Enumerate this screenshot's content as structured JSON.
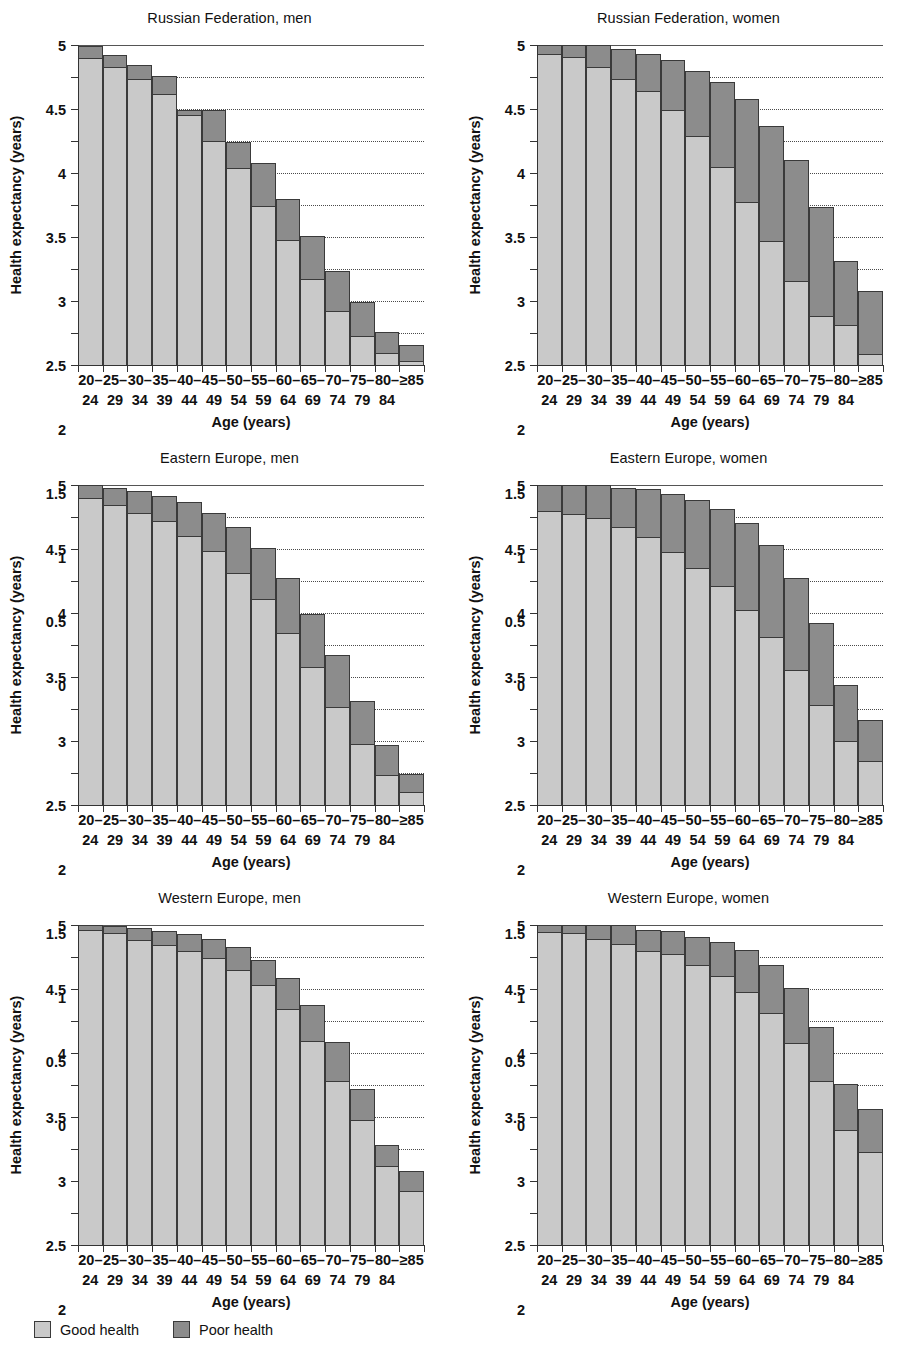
{
  "figure": {
    "y_axis_title": "Health expectancy (years)",
    "x_axis_title": "Age (years)",
    "y_ticks": [
      "0",
      "0.5",
      "1",
      "1.5",
      "2",
      "2.5",
      "3",
      "3.5",
      "4",
      "4.5",
      "5"
    ],
    "age_top": [
      "20–",
      "25–",
      "30–",
      "35–",
      "40–",
      "45–",
      "50–",
      "55–",
      "60–",
      "65–",
      "70–",
      "75–",
      "80–",
      "≥85"
    ],
    "age_bottom": [
      "24",
      "29",
      "34",
      "39",
      "44",
      "49",
      "54",
      "59",
      "64",
      "69",
      "74",
      "79",
      "84",
      ""
    ],
    "legend": [
      {
        "label": "Good health",
        "color": "#c9c9c9",
        "key": "good"
      },
      {
        "label": "Poor health",
        "color": "#8c8c8c",
        "key": "poor"
      }
    ],
    "panel_titles": [
      "Russian Federation, men",
      "Russian Federation, women",
      "Eastern Europe, men",
      "Eastern Europe, women",
      "Western Europe, men",
      "Western Europe, women"
    ]
  },
  "chart_data": [
    {
      "type": "bar",
      "title": "Russian Federation, men",
      "xlabel": "Age (years)",
      "ylabel": "Health expectancy (years)",
      "ylim": [
        0,
        5
      ],
      "grid": true,
      "stacked": true,
      "legend_position": "figure-bottom-left",
      "categories": [
        "20–24",
        "25–29",
        "30–34",
        "35–39",
        "40–44",
        "45–49",
        "50–54",
        "55–59",
        "60–64",
        "65–69",
        "70–74",
        "75–79",
        "80–84",
        "≥85"
      ],
      "series": [
        {
          "name": "Good health",
          "color": "#c9c9c9",
          "values": [
            4.79,
            4.66,
            4.47,
            4.23,
            3.9,
            3.5,
            3.08,
            2.48,
            1.96,
            1.34,
            0.85,
            0.46,
            0.18,
            0.06
          ]
        },
        {
          "name": "Poor health",
          "color": "#8c8c8c",
          "values": [
            0.2,
            0.19,
            0.21,
            0.28,
            0.09,
            0.48,
            0.4,
            0.67,
            0.63,
            0.68,
            0.62,
            0.52,
            0.34,
            0.26
          ]
        }
      ],
      "totals": [
        4.99,
        4.85,
        4.68,
        4.51,
        3.99,
        3.98,
        3.48,
        3.15,
        2.59,
        2.02,
        1.47,
        0.98,
        0.52,
        0.32
      ]
    },
    {
      "type": "bar",
      "title": "Russian Federation, women",
      "xlabel": "Age (years)",
      "ylabel": "Health expectancy (years)",
      "ylim": [
        0,
        5
      ],
      "grid": true,
      "stacked": true,
      "legend_position": "figure-bottom-left",
      "categories": [
        "20–24",
        "25–29",
        "30–34",
        "35–39",
        "40–44",
        "45–49",
        "50–54",
        "55–59",
        "60–64",
        "65–69",
        "70–74",
        "75–79",
        "80–84",
        "≥85"
      ],
      "series": [
        {
          "name": "Good health",
          "color": "#c9c9c9",
          "values": [
            4.86,
            4.81,
            4.66,
            4.47,
            4.28,
            3.99,
            3.58,
            3.09,
            2.54,
            1.93,
            1.31,
            0.76,
            0.63,
            0.17
          ]
        },
        {
          "name": "Poor health",
          "color": "#8c8c8c",
          "values": [
            0.14,
            0.19,
            0.34,
            0.46,
            0.58,
            0.78,
            1.02,
            1.34,
            1.61,
            1.81,
            1.89,
            1.71,
            1.0,
            0.99
          ]
        }
      ],
      "totals": [
        5.0,
        5.0,
        5.0,
        4.93,
        4.86,
        4.77,
        4.6,
        4.43,
        4.15,
        3.74,
        3.2,
        2.47,
        1.63,
        1.16
      ]
    },
    {
      "type": "bar",
      "title": "Eastern Europe, men",
      "xlabel": "Age (years)",
      "ylabel": "Health expectancy (years)",
      "ylim": [
        0,
        5
      ],
      "grid": true,
      "stacked": true,
      "legend_position": "figure-bottom-left",
      "categories": [
        "20–24",
        "25–29",
        "30–34",
        "35–39",
        "40–44",
        "45–49",
        "50–54",
        "55–59",
        "60–64",
        "65–69",
        "70–74",
        "75–79",
        "80–84",
        "≥85"
      ],
      "series": [
        {
          "name": "Good health",
          "color": "#c9c9c9",
          "values": [
            4.79,
            4.68,
            4.56,
            4.44,
            4.2,
            3.97,
            3.62,
            3.22,
            2.69,
            2.15,
            1.53,
            0.96,
            0.47,
            0.21
          ]
        },
        {
          "name": "Poor health",
          "color": "#8c8c8c",
          "values": [
            0.21,
            0.27,
            0.34,
            0.39,
            0.53,
            0.59,
            0.72,
            0.8,
            0.86,
            0.84,
            0.81,
            0.67,
            0.47,
            0.27
          ]
        }
      ],
      "totals": [
        5.0,
        4.95,
        4.9,
        4.83,
        4.73,
        4.56,
        4.34,
        4.02,
        3.55,
        2.99,
        2.34,
        1.63,
        0.94,
        0.48
      ]
    },
    {
      "type": "bar",
      "title": "Eastern Europe, women",
      "xlabel": "Age (years)",
      "ylabel": "Health expectancy (years)",
      "ylim": [
        0,
        5
      ],
      "grid": true,
      "stacked": true,
      "legend_position": "figure-bottom-left",
      "categories": [
        "20–24",
        "25–29",
        "30–34",
        "35–39",
        "40–44",
        "45–49",
        "50–54",
        "55–59",
        "60–64",
        "65–69",
        "70–74",
        "75–79",
        "80–84",
        "≥85"
      ],
      "series": [
        {
          "name": "Good health",
          "color": "#c9c9c9",
          "values": [
            4.59,
            4.54,
            4.48,
            4.35,
            4.19,
            3.96,
            3.71,
            3.42,
            3.05,
            2.62,
            2.11,
            1.57,
            1.0,
            0.68
          ]
        },
        {
          "name": "Poor health",
          "color": "#8c8c8c",
          "values": [
            0.41,
            0.46,
            0.52,
            0.61,
            0.75,
            0.9,
            1.06,
            1.2,
            1.35,
            1.44,
            1.43,
            1.27,
            0.88,
            0.65
          ]
        }
      ],
      "totals": [
        5.0,
        5.0,
        5.0,
        4.96,
        4.94,
        4.86,
        4.77,
        4.62,
        4.4,
        4.06,
        3.54,
        2.84,
        1.88,
        1.33
      ]
    },
    {
      "type": "bar",
      "title": "Western Europe, men",
      "xlabel": "Age (years)",
      "ylabel": "Health expectancy (years)",
      "ylim": [
        0,
        5
      ],
      "grid": true,
      "stacked": true,
      "legend_position": "figure-bottom-left",
      "categories": [
        "20–24",
        "25–29",
        "30–34",
        "35–39",
        "40–44",
        "45–49",
        "50–54",
        "55–59",
        "60–64",
        "65–69",
        "70–74",
        "75–79",
        "80–84",
        "≥85"
      ],
      "series": [
        {
          "name": "Good health",
          "color": "#c9c9c9",
          "values": [
            4.92,
            4.87,
            4.77,
            4.69,
            4.6,
            4.49,
            4.29,
            4.06,
            3.68,
            3.18,
            2.56,
            1.96,
            1.24,
            0.84
          ]
        },
        {
          "name": "Poor health",
          "color": "#8c8c8c",
          "values": [
            0.08,
            0.11,
            0.19,
            0.21,
            0.26,
            0.29,
            0.36,
            0.4,
            0.49,
            0.57,
            0.62,
            0.47,
            0.32,
            0.32
          ]
        }
      ],
      "totals": [
        5.0,
        4.98,
        4.96,
        4.9,
        4.86,
        4.78,
        4.65,
        4.46,
        4.17,
        3.75,
        3.18,
        2.43,
        1.56,
        1.16
      ]
    },
    {
      "type": "bar",
      "title": "Western Europe, women",
      "xlabel": "Age (years)",
      "ylabel": "Health expectancy (years)",
      "ylim": [
        0,
        5
      ],
      "grid": true,
      "stacked": true,
      "legend_position": "figure-bottom-left",
      "categories": [
        "20–24",
        "25–29",
        "30–34",
        "35–39",
        "40–44",
        "45–49",
        "50–54",
        "55–59",
        "60–64",
        "65–69",
        "70–74",
        "75–79",
        "80–84",
        "≥85"
      ],
      "series": [
        {
          "name": "Good health",
          "color": "#c9c9c9",
          "values": [
            4.89,
            4.87,
            4.78,
            4.71,
            4.6,
            4.55,
            4.38,
            4.2,
            3.96,
            3.62,
            3.15,
            2.57,
            1.8,
            1.45
          ]
        },
        {
          "name": "Poor health",
          "color": "#8c8c8c",
          "values": [
            0.11,
            0.13,
            0.22,
            0.29,
            0.33,
            0.35,
            0.44,
            0.54,
            0.65,
            0.76,
            0.87,
            0.84,
            0.72,
            0.67
          ]
        }
      ],
      "totals": [
        5.0,
        5.0,
        5.0,
        5.0,
        4.93,
        4.9,
        4.82,
        4.74,
        4.61,
        4.38,
        4.02,
        3.41,
        2.52,
        2.12
      ]
    }
  ]
}
